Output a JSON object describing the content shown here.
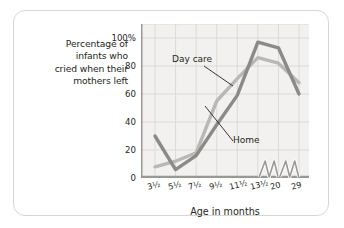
{
  "card": {
    "border_color": "#d8d6d2",
    "background": "#ffffff"
  },
  "chart_data": {
    "type": "line",
    "title": "",
    "subtitle": "",
    "ylabel": "Percentage of infants who cried when their mothers left",
    "ylabel_lines": [
      "Percentage of",
      "infants who",
      "cried when their",
      "mothers left"
    ],
    "xlabel": "Age in months",
    "categories": [
      "3½",
      "5½",
      "7½",
      "9½",
      "11½",
      "13½",
      "20",
      "29"
    ],
    "x": [
      3.5,
      5.5,
      7.5,
      9.5,
      11.5,
      13.5,
      20,
      29
    ],
    "ylim": [
      0,
      110
    ],
    "ytick_values": [
      0,
      20,
      40,
      60,
      80,
      100
    ],
    "ytick_labels": [
      "0",
      "20",
      "40",
      "60",
      "80",
      "100%"
    ],
    "grid": true,
    "grid_color": "#dcdad6",
    "plot_background": "#f2f1ef",
    "axis_color": "#9b9893",
    "axis_break": true,
    "axis_break_note": "zigzag break marks on x axis between 13½ and 20, and between 20 and 29",
    "legend_position": "inline-annotations",
    "series": [
      {
        "name": "Day care",
        "color": "#b9b8b5",
        "values": [
          8,
          12,
          18,
          55,
          71,
          86,
          82,
          68
        ]
      },
      {
        "name": "Home",
        "color": "#8b8a87",
        "values": [
          30,
          6,
          16,
          38,
          59,
          97,
          93,
          60
        ]
      }
    ],
    "annotations": [
      {
        "text": "Day care",
        "series": "Day care",
        "leader": true
      },
      {
        "text": "Home",
        "series": "Home",
        "leader": true
      }
    ]
  }
}
